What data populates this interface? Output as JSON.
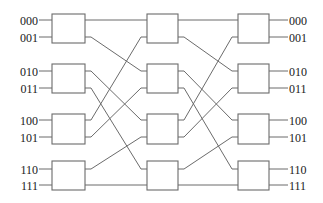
{
  "diagram": {
    "type": "omega-network-8x8",
    "stages": 3,
    "switches_per_stage": 4,
    "colors": {
      "line": "#6b6b6b",
      "text": "#1a1a1a",
      "background": "#ffffff"
    },
    "input_labels": [
      "000",
      "001",
      "010",
      "011",
      "100",
      "101",
      "110",
      "111"
    ],
    "output_labels": [
      "000",
      "001",
      "010",
      "011",
      "100",
      "101",
      "110",
      "111"
    ],
    "port_y": [
      20,
      37,
      71,
      88,
      120,
      137,
      169,
      185
    ],
    "switch_rows": [
      {
        "top": 14,
        "bottom": 43
      },
      {
        "top": 64,
        "bottom": 93
      },
      {
        "top": 114,
        "bottom": 144
      },
      {
        "top": 161,
        "bottom": 190
      }
    ],
    "stage_columns": [
      {
        "left": 52,
        "right": 85
      },
      {
        "left": 147,
        "right": 178
      },
      {
        "left": 238,
        "right": 269
      }
    ],
    "interstage_connections": [
      {
        "from_stage": 1,
        "to_stage": 2,
        "map": [
          0,
          2,
          4,
          6,
          1,
          3,
          5,
          7
        ]
      },
      {
        "from_stage": 2,
        "to_stage": 3,
        "map": [
          0,
          2,
          4,
          6,
          1,
          3,
          5,
          7
        ]
      }
    ]
  }
}
